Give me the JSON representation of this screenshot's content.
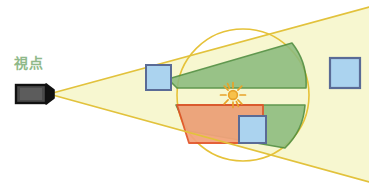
{
  "diagram": {
    "labels": {
      "viewpoint": "視点"
    },
    "colors": {
      "cone_fill": "#f4f5c8",
      "cone_edge": "#e0c53a",
      "circle_outline": "#e8c43c",
      "green_fill": "#8cbb7e",
      "green_stroke": "#4a8a3c",
      "orange_fill": "#f0a07a",
      "orange_stroke": "#e0562a",
      "blue_fill": "#abd3ef",
      "blue_stroke": "#5a6b96",
      "camera_body": "#3f3f3f",
      "camera_dark": "#1a1a1a",
      "sun_color": "#e8a32a",
      "label_color": "#8fb98a",
      "background": "#ffffff"
    },
    "elements": {
      "camera": {
        "name": "camera-viewpoint",
        "x": 16,
        "y": 85,
        "width": 32,
        "height": 18
      },
      "sun": {
        "name": "sun-light-source",
        "cx": 233,
        "cy": 95,
        "radius": 5,
        "ray_count": 10
      },
      "view_cone": {
        "apex_x": 49,
        "apex_y": 94,
        "upper_end_x": 369,
        "upper_end_y": 7,
        "lower_end_x": 369,
        "lower_end_y": 182
      },
      "circle": {
        "cx": 243,
        "cy": 95,
        "r": 66
      },
      "green_upper_wedge": {
        "name": "visible-region-upper"
      },
      "green_lower_wedge": {
        "name": "visible-region-lower"
      },
      "orange_region": {
        "name": "occluded-region"
      },
      "squares": [
        {
          "name": "object-square-left",
          "x": 146,
          "y": 65,
          "size": 25
        },
        {
          "name": "object-square-center",
          "x": 239,
          "y": 116,
          "size": 27
        },
        {
          "name": "object-square-right",
          "x": 330,
          "y": 58,
          "size": 30
        }
      ]
    }
  }
}
